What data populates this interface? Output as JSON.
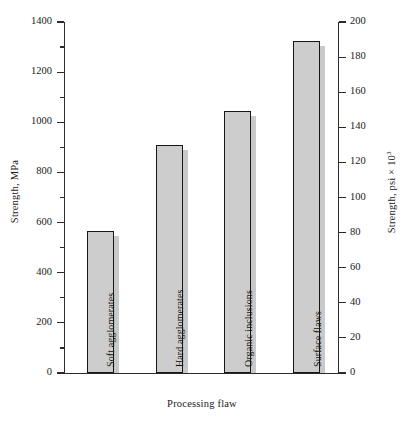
{
  "chart_data": {
    "type": "bar",
    "title": "",
    "xlabel": "Processing flaw",
    "ylabel": "Strength, MPa",
    "y2label": "Strength, psi × 10³",
    "categories": [
      "Soft agglomerates",
      "Hard agglomerates",
      "Organic inclusions",
      "Surface flaws"
    ],
    "values": [
      565,
      910,
      1045,
      1325
    ],
    "values_psi_x1000": [
      82,
      132,
      152,
      192
    ],
    "ylim": [
      0,
      1400
    ],
    "y2lim": [
      0,
      200
    ],
    "yticks": [
      0,
      200,
      400,
      600,
      800,
      1000,
      1200,
      1400
    ],
    "yminorticks": [
      100,
      300,
      500,
      700,
      900,
      1100,
      1300
    ],
    "y2ticks": [
      0,
      20,
      40,
      60,
      80,
      100,
      120,
      140,
      160,
      180,
      200
    ],
    "grid": false,
    "legend": false,
    "bar_fill_color": "#cdcdcd",
    "bar_edge_color": "#161616",
    "bar_shadow_color": "#c9c9c9"
  },
  "axes": {
    "left_title": "Strength, MPa",
    "right_title_prefix": "Strength, psi × 10",
    "right_title_exponent": "3",
    "x_title": "Processing flaw",
    "left_ticks": [
      {
        "label": "1400",
        "value": 1400
      },
      {
        "label": "1200",
        "value": 1200
      },
      {
        "label": "1000",
        "value": 1000
      },
      {
        "label": "800",
        "value": 800
      },
      {
        "label": "600",
        "value": 600
      },
      {
        "label": "400",
        "value": 400
      },
      {
        "label": "200",
        "value": 200
      },
      {
        "label": "0",
        "value": 0
      }
    ],
    "right_ticks": [
      {
        "label": "200",
        "value": 200
      },
      {
        "label": "180",
        "value": 180
      },
      {
        "label": "160",
        "value": 160
      },
      {
        "label": "140",
        "value": 140
      },
      {
        "label": "120",
        "value": 120
      },
      {
        "label": "100",
        "value": 100
      },
      {
        "label": "80",
        "value": 80
      },
      {
        "label": "60",
        "value": 60
      },
      {
        "label": "40",
        "value": 40
      },
      {
        "label": "20",
        "value": 20
      },
      {
        "label": "0",
        "value": 0
      }
    ]
  },
  "bars": [
    {
      "label": "Soft agglomerates",
      "value": 565
    },
    {
      "label": "Hard agglomerates",
      "value": 910
    },
    {
      "label": "Organic inclusions",
      "value": 1045
    },
    {
      "label": "Surface flaws",
      "value": 1325
    }
  ]
}
